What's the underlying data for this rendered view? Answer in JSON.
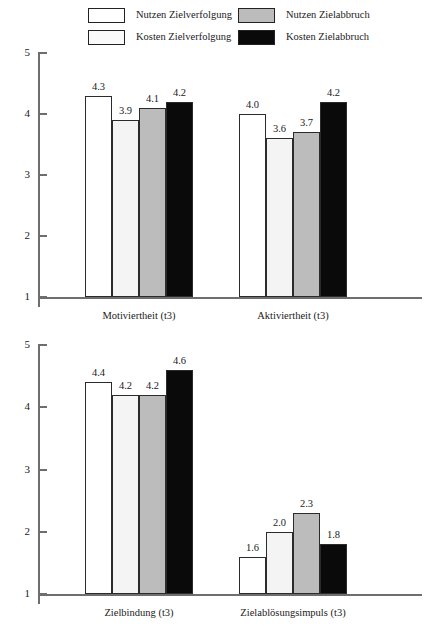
{
  "legend": {
    "entries": [
      {
        "label": "Nutzen Zielverfolgung",
        "color": "#ffffff",
        "row": 0,
        "col": 0
      },
      {
        "label": "Nutzen Zielabbruch",
        "color": "#bcbcbc",
        "row": 0,
        "col": 1
      },
      {
        "label": "Kosten Zielverfolgung",
        "color": "#fafafa",
        "row": 1,
        "col": 0
      },
      {
        "label": "Kosten Zielabbruch",
        "color": "#0a0a0a",
        "row": 1,
        "col": 1
      }
    ]
  },
  "colors": {
    "series_nutzen_zielverfolgung": "#ffffff",
    "series_kosten_zielverfolgung": "#f4f4f4",
    "series_nutzen_zielabbruch": "#bcbcbc",
    "series_kosten_zielabbruch": "#0a0a0a",
    "axis": "#6e6e6e",
    "bar_outline": "#2b2b2b",
    "text": "#1a1a1a"
  },
  "chart_data": [
    {
      "type": "bar",
      "title": "",
      "xlabel": "",
      "ylabel": "",
      "ylim": [
        1,
        5
      ],
      "yticks": [
        "1",
        "2",
        "3",
        "4",
        "5"
      ],
      "grid": false,
      "legend_position": "top",
      "categories": [
        "Motiviertheit (t3)",
        "Aktiviertheit (t3)"
      ],
      "series": [
        {
          "name": "Nutzen Zielverfolgung",
          "values": [
            4.3,
            4.0
          ],
          "labels": [
            "4.3",
            "4.0"
          ]
        },
        {
          "name": "Kosten Zielverfolgung",
          "values": [
            3.9,
            3.6
          ],
          "labels": [
            "3.9",
            "3.6"
          ]
        },
        {
          "name": "Nutzen Zielabbruch",
          "values": [
            4.1,
            3.7
          ],
          "labels": [
            "4.1",
            "3.7"
          ]
        },
        {
          "name": "Kosten Zielabbruch",
          "values": [
            4.2,
            4.2
          ],
          "labels": [
            "4.2",
            "4.2"
          ]
        }
      ]
    },
    {
      "type": "bar",
      "title": "",
      "xlabel": "",
      "ylabel": "",
      "ylim": [
        1,
        5
      ],
      "yticks": [
        "1",
        "2",
        "3",
        "4",
        "5"
      ],
      "grid": false,
      "legend_position": "top",
      "categories": [
        "Zielbindung (t3)",
        "Zielablösungsimpuls (t3)"
      ],
      "series": [
        {
          "name": "Nutzen Zielverfolgung",
          "values": [
            4.4,
            1.6
          ],
          "labels": [
            "4.4",
            "1.6"
          ]
        },
        {
          "name": "Kosten Zielverfolgung",
          "values": [
            4.2,
            2.0
          ],
          "labels": [
            "4.2",
            "2.0"
          ]
        },
        {
          "name": "Nutzen Zielabbruch",
          "values": [
            4.2,
            2.3
          ],
          "labels": [
            "4.2",
            "2.3"
          ]
        },
        {
          "name": "Kosten Zielabbruch",
          "values": [
            4.6,
            1.8
          ],
          "labels": [
            "4.6",
            "1.8"
          ]
        }
      ]
    }
  ]
}
